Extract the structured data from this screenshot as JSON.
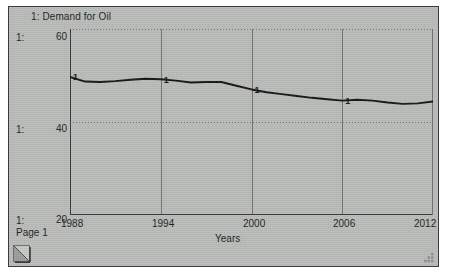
{
  "window": {
    "page_label": "Page 1",
    "background_color": "#b9bcb9"
  },
  "legend": {
    "entry": "1: Demand for Oil"
  },
  "gutter": {
    "scale_labels": [
      "1:",
      "1:",
      "1:"
    ]
  },
  "icons": {
    "page_corner": "page-fold-icon",
    "resize_grip": "resize-grip-icon"
  },
  "chart_data": {
    "type": "line",
    "title": "1: Demand for Oil",
    "xlabel": "Years",
    "ylabel": "",
    "xlim": [
      1988,
      2012
    ],
    "ylim": [
      20,
      60
    ],
    "grid": true,
    "legend_position": "top-left",
    "xticks": [
      "1988",
      "1994",
      "2000",
      "2006",
      "2012"
    ],
    "yticks": [
      "20",
      "40",
      "60"
    ],
    "series": [
      {
        "name": "1: Demand for Oil",
        "color": "#141414",
        "marker_label": "1",
        "marker_years": [
          1988,
          1994,
          2000,
          2006
        ],
        "x": [
          1988,
          1989,
          1990,
          1991,
          1992,
          1993,
          1994,
          1995,
          1996,
          1997,
          1998,
          1999,
          2000,
          2001,
          2002,
          2003,
          2004,
          2005,
          2006,
          2007,
          2008,
          2009,
          2010,
          2011,
          2012
        ],
        "values": [
          49.7,
          48.7,
          48.6,
          48.8,
          49.1,
          49.3,
          49.2,
          48.9,
          48.5,
          48.6,
          48.6,
          47.8,
          47.0,
          46.4,
          46.0,
          45.6,
          45.2,
          44.9,
          44.6,
          44.8,
          44.6,
          44.2,
          43.9,
          44.0,
          44.4
        ]
      }
    ]
  }
}
